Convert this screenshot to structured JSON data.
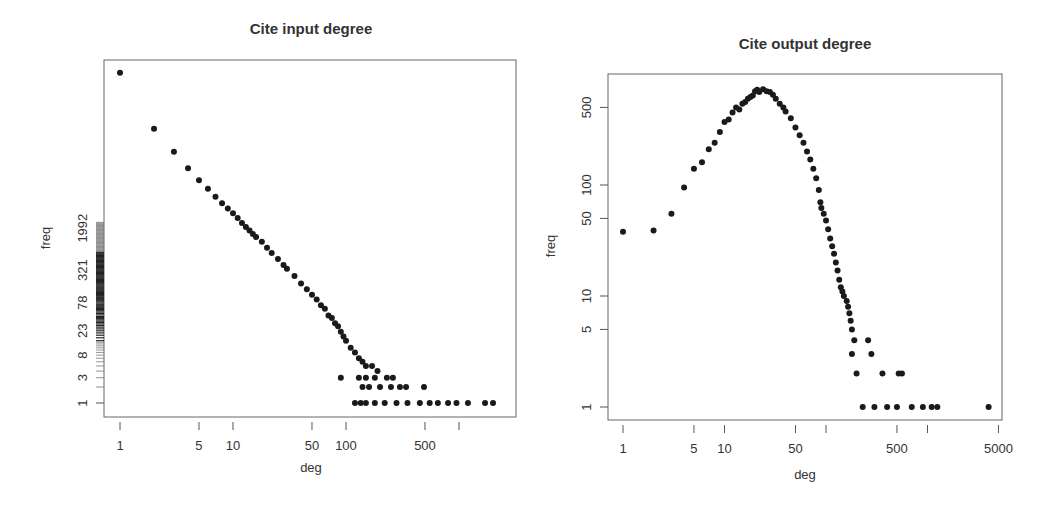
{
  "chart_data": [
    {
      "type": "scatter",
      "title": "Cite input degree",
      "xlabel": "deg",
      "ylabel": "freq",
      "xscale": "log",
      "yscale": "log",
      "x_ticks": [
        1,
        5,
        10,
        50,
        100,
        500,
        1000
      ],
      "x_tick_labels": [
        "1",
        "5",
        "10",
        "50",
        "100",
        "500",
        ""
      ],
      "y_tick_labels": [
        "1",
        "3",
        "8",
        "23",
        "78",
        "321",
        "1992"
      ],
      "y_rug": true,
      "grid": false,
      "series": [
        {
          "name": "in-degree",
          "points": [
            [
              1,
              1700000
            ],
            [
              2,
              150000
            ],
            [
              3,
              55000
            ],
            [
              4,
              27000
            ],
            [
              5,
              16000
            ],
            [
              6,
              11000
            ],
            [
              7,
              7800
            ],
            [
              8,
              5900
            ],
            [
              9,
              4700
            ],
            [
              10,
              3800
            ],
            [
              11,
              3100
            ],
            [
              12,
              2500
            ],
            [
              13,
              2100
            ],
            [
              14,
              1800
            ],
            [
              15,
              1550
            ],
            [
              16,
              1350
            ],
            [
              18,
              1100
            ],
            [
              20,
              850
            ],
            [
              22,
              680
            ],
            [
              25,
              520
            ],
            [
              28,
              400
            ],
            [
              30,
              340
            ],
            [
              35,
              250
            ],
            [
              40,
              180
            ],
            [
              45,
              140
            ],
            [
              50,
              110
            ],
            [
              55,
              90
            ],
            [
              60,
              70
            ],
            [
              65,
              60
            ],
            [
              70,
              45
            ],
            [
              75,
              40
            ],
            [
              80,
              32
            ],
            [
              85,
              28
            ],
            [
              90,
              22
            ],
            [
              95,
              18
            ],
            [
              100,
              15
            ],
            [
              110,
              11
            ],
            [
              120,
              9
            ],
            [
              130,
              7
            ],
            [
              140,
              6
            ],
            [
              150,
              5
            ],
            [
              170,
              5
            ],
            [
              190,
              4
            ],
            [
              90,
              3
            ],
            [
              130,
              3
            ],
            [
              150,
              3
            ],
            [
              180,
              3
            ],
            [
              230,
              3
            ],
            [
              260,
              3
            ],
            [
              140,
              2
            ],
            [
              160,
              2
            ],
            [
              200,
              2
            ],
            [
              250,
              2
            ],
            [
              300,
              2
            ],
            [
              340,
              2
            ],
            [
              490,
              2
            ],
            [
              120,
              1
            ],
            [
              135,
              1
            ],
            [
              150,
              1
            ],
            [
              180,
              1
            ],
            [
              220,
              1
            ],
            [
              280,
              1
            ],
            [
              350,
              1
            ],
            [
              450,
              1
            ],
            [
              550,
              1
            ],
            [
              650,
              1
            ],
            [
              800,
              1
            ],
            [
              950,
              1
            ],
            [
              1200,
              1
            ],
            [
              1700,
              1
            ],
            [
              2000,
              1
            ]
          ]
        }
      ]
    },
    {
      "type": "scatter",
      "title": "Cite output degree",
      "xlabel": "deg",
      "ylabel": "freq",
      "xscale": "log",
      "yscale": "log",
      "x_ticks": [
        1,
        5,
        10,
        50,
        100,
        500,
        1000,
        5000
      ],
      "x_tick_labels": [
        "1",
        "5",
        "10",
        "50",
        "",
        "500",
        "",
        "5000"
      ],
      "y_ticks": [
        1,
        5,
        10,
        50,
        100,
        500
      ],
      "y_tick_labels": [
        "1",
        "5",
        "10",
        "50",
        "100",
        "500"
      ],
      "grid": false,
      "series": [
        {
          "name": "out-degree",
          "points": [
            [
              1,
              38
            ],
            [
              2,
              39
            ],
            [
              3,
              55
            ],
            [
              4,
              95
            ],
            [
              5,
              140
            ],
            [
              6,
              160
            ],
            [
              7,
              210
            ],
            [
              8,
              240
            ],
            [
              9,
              300
            ],
            [
              10,
              370
            ],
            [
              11,
              390
            ],
            [
              12,
              450
            ],
            [
              13,
              500
            ],
            [
              14,
              480
            ],
            [
              15,
              540
            ],
            [
              16,
              560
            ],
            [
              17,
              600
            ],
            [
              18,
              620
            ],
            [
              19,
              640
            ],
            [
              20,
              700
            ],
            [
              21,
              720
            ],
            [
              22,
              690
            ],
            [
              24,
              730
            ],
            [
              26,
              700
            ],
            [
              28,
              690
            ],
            [
              30,
              650
            ],
            [
              32,
              600
            ],
            [
              35,
              540
            ],
            [
              38,
              500
            ],
            [
              40,
              460
            ],
            [
              45,
              400
            ],
            [
              50,
              330
            ],
            [
              55,
              280
            ],
            [
              60,
              240
            ],
            [
              65,
              200
            ],
            [
              70,
              170
            ],
            [
              75,
              140
            ],
            [
              80,
              115
            ],
            [
              85,
              90
            ],
            [
              88,
              70
            ],
            [
              90,
              62
            ],
            [
              95,
              55
            ],
            [
              100,
              48
            ],
            [
              105,
              40
            ],
            [
              110,
              33
            ],
            [
              115,
              28
            ],
            [
              120,
              24
            ],
            [
              125,
              20
            ],
            [
              130,
              17
            ],
            [
              135,
              14
            ],
            [
              140,
              12
            ],
            [
              145,
              11
            ],
            [
              150,
              10
            ],
            [
              160,
              9
            ],
            [
              165,
              8
            ],
            [
              170,
              7
            ],
            [
              175,
              6
            ],
            [
              180,
              5
            ],
            [
              190,
              4
            ],
            [
              260,
              4
            ],
            [
              180,
              3
            ],
            [
              280,
              3
            ],
            [
              200,
              2
            ],
            [
              360,
              2
            ],
            [
              520,
              2
            ],
            [
              560,
              2
            ],
            [
              230,
              1
            ],
            [
              300,
              1
            ],
            [
              400,
              1
            ],
            [
              500,
              1
            ],
            [
              700,
              1
            ],
            [
              900,
              1
            ],
            [
              1100,
              1
            ],
            [
              1250,
              1
            ],
            [
              4000,
              1
            ]
          ]
        }
      ]
    }
  ],
  "panels": [
    {
      "title": "Cite input degree",
      "xlabel": "deg",
      "ylabel": "freq",
      "x_tick_labels": [
        "1",
        "5",
        "10",
        "50",
        "100",
        "500"
      ],
      "y_tick_labels": [
        "1",
        "3",
        "8",
        "23",
        "78",
        "321",
        "1992"
      ]
    },
    {
      "title": "Cite output degree",
      "xlabel": "deg",
      "ylabel": "freq",
      "x_tick_labels": [
        "1",
        "5",
        "10",
        "50",
        "500",
        "5000"
      ],
      "y_tick_labels": [
        "1",
        "5",
        "10",
        "50",
        "100",
        "500"
      ]
    }
  ],
  "colors": {
    "points": "#1a1a1a",
    "axis": "#555555",
    "text": "#333333",
    "background": "#ffffff"
  }
}
